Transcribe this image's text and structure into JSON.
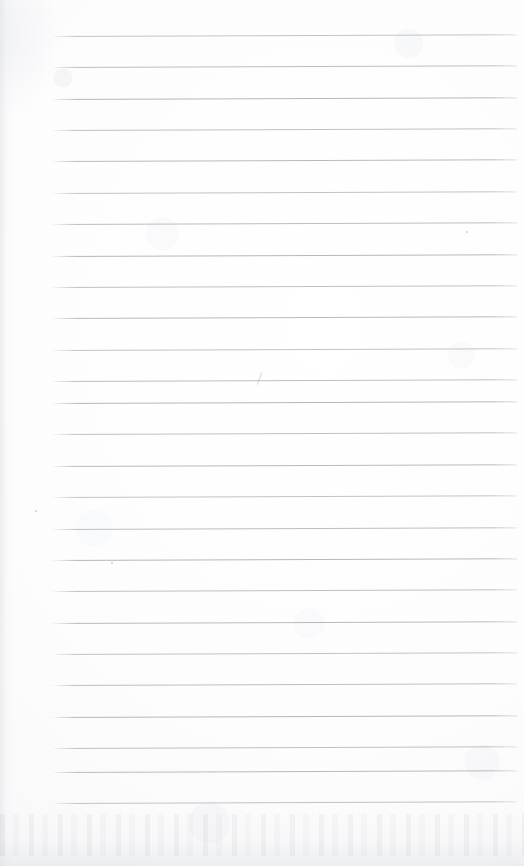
{
  "document": {
    "kind": "scanned-lined-notebook-page",
    "title": "",
    "body_text": "",
    "page_width": 524,
    "page_height": 866,
    "has_written_content": false,
    "background_color": "#fdfdfd",
    "paper_tone_color": "#fafafb"
  },
  "ruling": {
    "line_color": "#b2b5b8",
    "line_thickness_px": 1,
    "line_count": 25,
    "line_start_x": 51,
    "line_end_x": 517,
    "first_line_y": 36,
    "line_spacing_px": 31.4,
    "tilt_degrees": -0.22,
    "left_margin_rule": false,
    "lines_y": [
      36,
      67,
      99,
      130,
      161,
      193,
      224,
      256,
      287,
      318,
      350,
      381,
      403,
      434,
      466,
      497,
      529,
      560,
      591,
      623,
      654,
      685,
      717,
      748,
      772,
      803
    ]
  },
  "artifacts": {
    "left_edge_shadow": true,
    "bottom_edge_shadow": true,
    "pencil_mark": {
      "x": 257,
      "y": 372,
      "label": "faint-pencil-stroke"
    },
    "specks": [
      {
        "x": 35,
        "y": 510
      },
      {
        "x": 111,
        "y": 562
      },
      {
        "x": 466,
        "y": 231
      }
    ]
  }
}
